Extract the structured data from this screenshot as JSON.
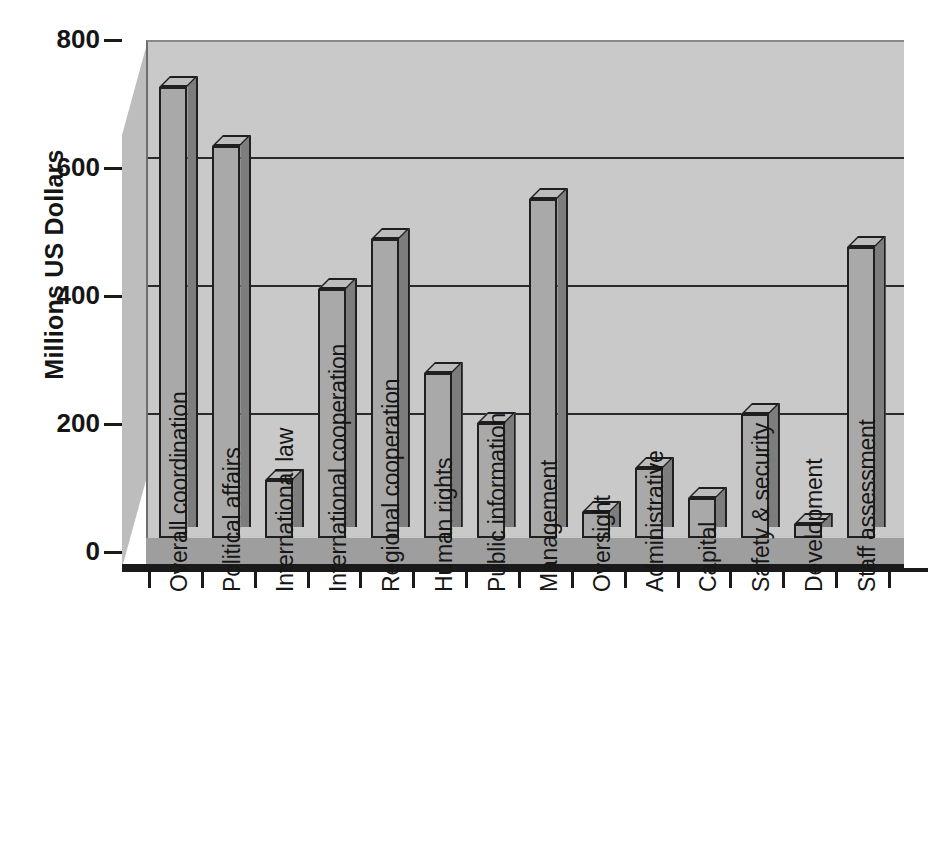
{
  "chart_data": {
    "type": "bar",
    "title": "",
    "xlabel": "",
    "ylabel": "Millions US Dollars",
    "ylim": [
      0,
      800
    ],
    "yticks": [
      0,
      200,
      400,
      600,
      800
    ],
    "grid": true,
    "legend": "none",
    "style": "3d-bar",
    "categories": [
      "Overall coordination",
      "Political affairs",
      "International law",
      "International cooperation",
      "Regional cooperation",
      "Human rights",
      "Public information",
      "Management",
      "Oversight",
      "Administrative",
      "Capital",
      "Safety & security",
      "Development",
      "Staff assessment"
    ],
    "values": [
      725,
      630,
      94,
      400,
      480,
      265,
      185,
      545,
      42,
      112,
      65,
      200,
      22,
      468
    ]
  },
  "colors": {
    "bar_face": "#a9a9a9",
    "bar_side": "#7d7d7d",
    "bar_top": "#bdbdbd",
    "plot_background": "#c9c9c9",
    "floor": "#9e9e9e",
    "axis": "#1a1a1a",
    "text": "#151515"
  }
}
